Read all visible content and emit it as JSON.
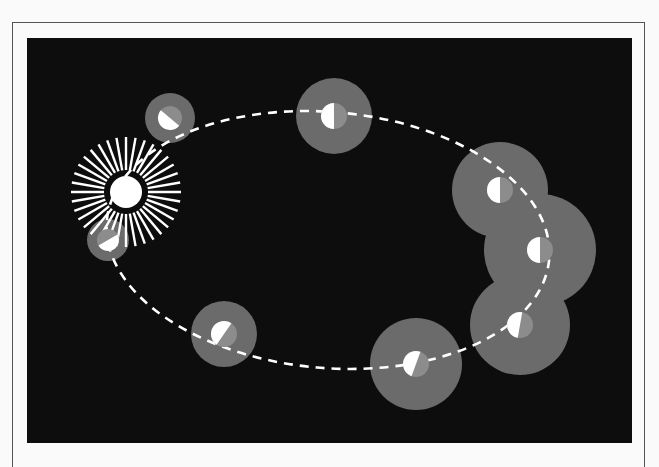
{
  "diagram": {
    "colors": {
      "background": "#0d0d0d",
      "coma": "#6b6b6b",
      "nucleus_dark": "#8c8c8c",
      "nucleus_lit": "#ffffff",
      "orbit": "#ffffff",
      "sun": "#ffffff"
    },
    "sun": {
      "cx": 126,
      "cy": 192,
      "r": 16,
      "rays": 36,
      "ray_inner": 22,
      "ray_outer": 55
    },
    "orbit": {
      "cx": 328,
      "cy": 240,
      "rx": 222,
      "ry": 128,
      "rotate": 5,
      "dash": "9 7"
    },
    "comets": [
      {
        "name": "comet-position-1",
        "cx": 170,
        "cy": 118,
        "coma_r": 25,
        "nucleus_r": 12,
        "lit_angle": 130
      },
      {
        "name": "comet-position-2",
        "cx": 334,
        "cy": 116,
        "coma_r": 38,
        "nucleus_r": 13,
        "lit_angle": 180
      },
      {
        "name": "comet-position-3",
        "cx": 500,
        "cy": 190,
        "coma_r": 48,
        "nucleus_r": 13,
        "lit_angle": 180
      },
      {
        "name": "comet-position-4",
        "cx": 540,
        "cy": 250,
        "coma_r": 56,
        "nucleus_r": 13,
        "lit_angle": 180
      },
      {
        "name": "comet-position-5",
        "cx": 520,
        "cy": 325,
        "coma_r": 50,
        "nucleus_r": 13,
        "lit_angle": 190
      },
      {
        "name": "comet-position-6",
        "cx": 416,
        "cy": 364,
        "coma_r": 46,
        "nucleus_r": 13,
        "lit_angle": 200
      },
      {
        "name": "comet-position-7",
        "cx": 224,
        "cy": 334,
        "coma_r": 33,
        "nucleus_r": 13,
        "lit_angle": 215
      },
      {
        "name": "comet-position-8",
        "cx": 108,
        "cy": 240,
        "coma_r": 21,
        "nucleus_r": 11,
        "lit_angle": 60
      }
    ]
  }
}
